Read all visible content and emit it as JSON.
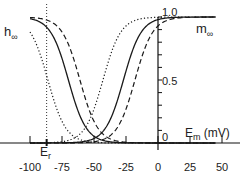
{
  "chart_data": {
    "type": "line",
    "title": "",
    "xlabel": "E_m (mV)",
    "ylabel": "",
    "xlim": [
      -103,
      53
    ],
    "ylim": [
      0,
      1.0
    ],
    "x_ticks": [
      -100,
      -75,
      -50,
      -25,
      0,
      25,
      50
    ],
    "x_tick_labels": [
      "-100",
      "-75",
      "-50",
      "-25",
      "0",
      "25",
      "50"
    ],
    "y_tick_labels": [
      {
        "value": 1.0,
        "label": "1.0"
      },
      {
        "value": 0.5,
        "label": "0.5"
      },
      {
        "value": 0.0,
        "label": "0"
      }
    ],
    "y_minor_step": 0.1,
    "grid": false,
    "legend": null,
    "annotations": [
      {
        "text": "h",
        "subscript": "∞",
        "position": "left, near y=0.85"
      },
      {
        "text": "m",
        "subscript": "∞",
        "position": "right, near y=0.85"
      },
      {
        "text": "E",
        "subscript": "r",
        "position": "x-axis at -87 mV",
        "x": -87
      }
    ],
    "reversal_line": {
      "x": -87,
      "style": "dotted"
    },
    "series": [
      {
        "name": "h_inf (dotted)",
        "kind": "inactivation",
        "style": "dotted",
        "v_half": -86,
        "slope_k": 7
      },
      {
        "name": "h_inf (solid)",
        "kind": "inactivation",
        "style": "solid",
        "v_half": -70,
        "slope_k": 7
      },
      {
        "name": "h_inf (dashed)",
        "kind": "inactivation",
        "style": "dashed",
        "v_half": -61,
        "slope_k": 7
      },
      {
        "name": "m_inf (dotted)",
        "kind": "activation",
        "style": "dotted",
        "v_half": -43,
        "slope_k": 7
      },
      {
        "name": "m_inf (solid)",
        "kind": "activation",
        "style": "solid",
        "v_half": -27,
        "slope_k": 7
      },
      {
        "name": "m_inf (dashed)",
        "kind": "activation",
        "style": "dashed",
        "v_half": -18,
        "slope_k": 7
      }
    ],
    "x_range_plotted": [
      -100,
      45
    ]
  },
  "labels": {
    "h_main": "h",
    "h_sub": "∞",
    "m_main": "m",
    "m_sub": "∞",
    "er_main": "E",
    "er_sub": "r",
    "xlabel_main": "E",
    "xlabel_sub": "m",
    "xlabel_unit": " (mV)",
    "y_top": "1.0",
    "y_mid": "0.5",
    "y_zero": "0"
  }
}
